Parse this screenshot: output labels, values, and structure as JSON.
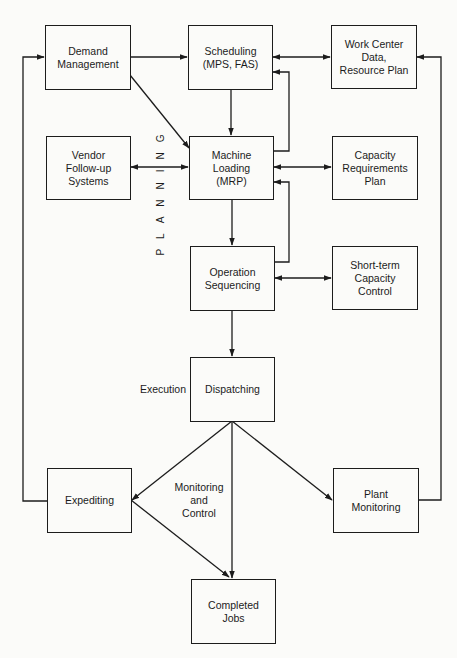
{
  "diagram": {
    "header_fragment": "",
    "stroke_color": "#1c1c1c",
    "background_color": "#fbfbf9",
    "section_labels": {
      "planning": "PLANNING",
      "execution": "Execution",
      "monitoring": "Monitoring\nand\nControl"
    },
    "nodes": {
      "demand_management": "Demand\nManagement",
      "scheduling": "Scheduling\n(MPS, FAS)",
      "work_center": "Work Center\nData,\nResource Plan",
      "vendor_followup": "Vendor\nFollow-up\nSystems",
      "machine_loading": "Machine\nLoading\n(MRP)",
      "capacity_requirements": "Capacity\nRequirements\nPlan",
      "operation_sequencing": "Operation\nSequencing",
      "short_term_capacity": "Short-term\nCapacity\nControl",
      "dispatching": "Dispatching",
      "expediting": "Expediting",
      "plant_monitoring": "Plant\nMonitoring",
      "completed_jobs": "Completed\nJobs"
    },
    "edges": [
      {
        "from": "Demand Management",
        "to": "Scheduling",
        "type": "arrow"
      },
      {
        "from": "Demand Management",
        "to": "Machine Loading",
        "type": "arrow"
      },
      {
        "from": "Scheduling",
        "to": "Work Center Data",
        "type": "bidirectional"
      },
      {
        "from": "Scheduling",
        "to": "Machine Loading",
        "type": "arrow"
      },
      {
        "from": "Machine Loading",
        "to": "Scheduling",
        "type": "feedback"
      },
      {
        "from": "Vendor Follow-up",
        "to": "Machine Loading",
        "type": "bidirectional"
      },
      {
        "from": "Machine Loading",
        "to": "Capacity Requirements Plan",
        "type": "bidirectional"
      },
      {
        "from": "Machine Loading",
        "to": "Operation Sequencing",
        "type": "arrow"
      },
      {
        "from": "Operation Sequencing",
        "to": "Machine Loading",
        "type": "feedback"
      },
      {
        "from": "Operation Sequencing",
        "to": "Short-term Capacity Control",
        "type": "bidirectional"
      },
      {
        "from": "Operation Sequencing",
        "to": "Dispatching",
        "type": "arrow"
      },
      {
        "from": "Dispatching",
        "to": "Expediting",
        "type": "arrow"
      },
      {
        "from": "Dispatching",
        "to": "Completed Jobs",
        "type": "arrow"
      },
      {
        "from": "Dispatching",
        "to": "Plant Monitoring",
        "type": "arrow"
      },
      {
        "from": "Expediting",
        "to": "Completed Jobs",
        "type": "arrow"
      },
      {
        "from": "Expediting",
        "to": "Demand Management",
        "type": "feedback"
      },
      {
        "from": "Plant Monitoring",
        "to": "Work Center Data",
        "type": "feedback"
      }
    ]
  }
}
